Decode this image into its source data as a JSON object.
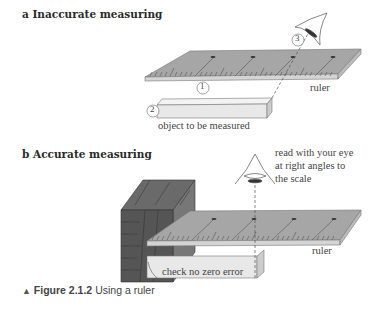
{
  "figure": {
    "panel_a": {
      "heading": "a Inaccurate measuring",
      "labels": {
        "marker_1": "1",
        "marker_2": "2",
        "marker_3": "3",
        "ruler": "ruler",
        "object": "object to be measured"
      }
    },
    "panel_b": {
      "heading": "b Accurate measuring",
      "labels": {
        "eye_note_line1": "read with your eye",
        "eye_note_line2": "at right angles to",
        "eye_note_line3": "the scale",
        "ruler": "ruler",
        "zero_error": "check no zero error"
      }
    },
    "caption": {
      "marker": "▲",
      "figure_number": "Figure 2.1.2",
      "text": "Using a ruler"
    },
    "colors": {
      "ruler_top": "#a6a6a6",
      "ruler_edge": "#d4d4d4",
      "object_fill": "#e8e8e8",
      "wood": "#5a5a5a",
      "text": "#444444"
    }
  }
}
